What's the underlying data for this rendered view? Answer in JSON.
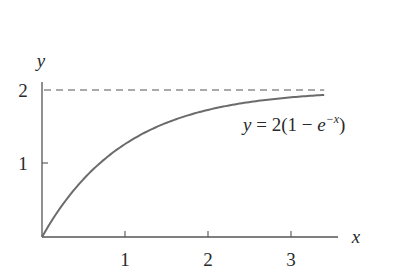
{
  "chart_data": {
    "type": "line",
    "title": "",
    "xlabel": "x",
    "ylabel": "y",
    "xlim": [
      0,
      3.4
    ],
    "ylim": [
      0,
      2.1
    ],
    "x_ticks": [
      1,
      2,
      3
    ],
    "x_tick_labels": [
      "1",
      "2",
      "3"
    ],
    "y_ticks": [
      1,
      2
    ],
    "y_tick_labels": [
      "1",
      "2"
    ],
    "grid": false,
    "legend": null,
    "series": [
      {
        "name": "y = 2(1 − e^(−x))",
        "style": "solid",
        "color": "#6b6b6b",
        "x": [
          0,
          0.25,
          0.5,
          0.75,
          1.0,
          1.25,
          1.5,
          1.75,
          2.0,
          2.25,
          2.5,
          2.75,
          3.0,
          3.25,
          3.4
        ],
        "y": [
          0,
          0.442,
          0.787,
          1.055,
          1.264,
          1.427,
          1.554,
          1.652,
          1.729,
          1.789,
          1.836,
          1.872,
          1.9,
          1.922,
          1.933
        ]
      },
      {
        "name": "asymptote y = 2",
        "style": "dashed",
        "color": "#555555",
        "x": [
          0,
          3.4
        ],
        "y": [
          2,
          2
        ]
      }
    ],
    "annotations": [
      {
        "text_prefix": "y",
        "text_main": " = 2(1 − ",
        "text_e": "e",
        "text_sup": "−x",
        "text_suffix": ")",
        "x": 2.4,
        "y": 1.45
      }
    ]
  }
}
